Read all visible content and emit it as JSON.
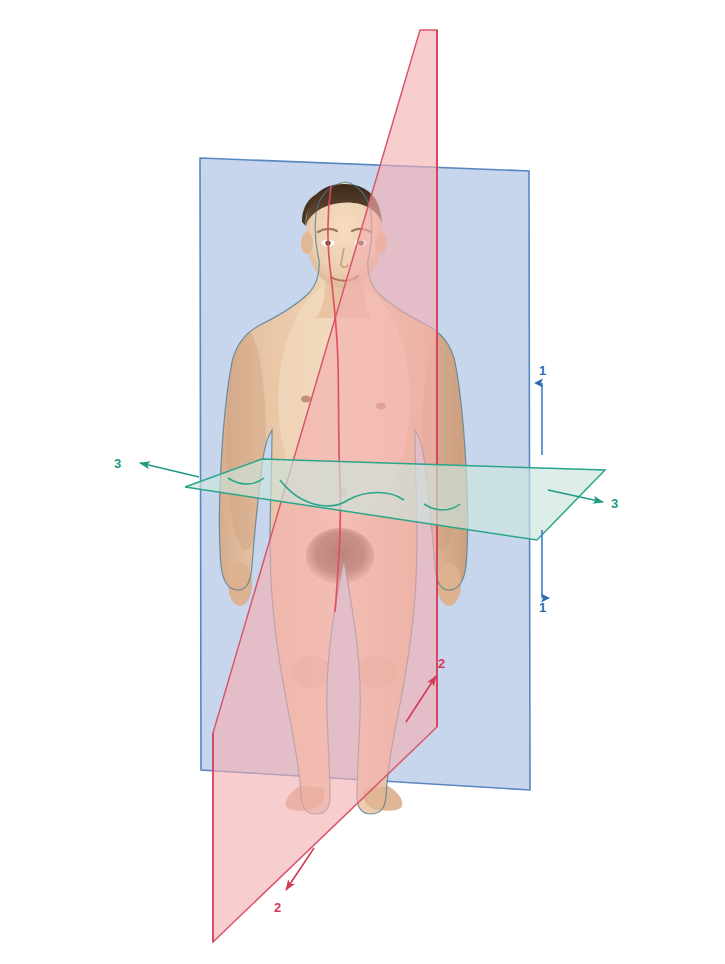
{
  "figure": {
    "background_color": "#ffffff"
  },
  "planes": [
    {
      "id": "coronal-plane",
      "name": "Coronal (frontal) plane",
      "shape": "rectangle-perspective",
      "fill_color": "#b9cce8",
      "stroke_color": "#4a7fc0",
      "opacity": "0.72",
      "label_number": "1"
    },
    {
      "id": "sagittal-plane",
      "name": "Median sagittal plane",
      "shape": "parallelogram-perspective",
      "fill_color": "#f3aeb0",
      "stroke_color": "#d63a57",
      "opacity": "0.68",
      "label_number": "2"
    },
    {
      "id": "transverse-plane",
      "name": "Transverse (horizontal) plane",
      "shape": "parallelogram-perspective",
      "fill_color": "#cce5dc",
      "stroke_color": "#2aa58c",
      "opacity": "0.62",
      "label_number": "3"
    }
  ],
  "callouts": [
    {
      "id": "callout-1-up",
      "label": "1",
      "color": "#2e6db4",
      "direction": "up",
      "plane": "coronal-plane"
    },
    {
      "id": "callout-1-down",
      "label": "1",
      "color": "#2e6db4",
      "direction": "down",
      "plane": "coronal-plane"
    },
    {
      "id": "callout-2-upper-right",
      "label": "2",
      "color": "#d63a57",
      "direction": "up-right",
      "plane": "sagittal-plane"
    },
    {
      "id": "callout-2-lower-left",
      "label": "2",
      "color": "#d63a57",
      "direction": "down-left",
      "plane": "sagittal-plane"
    },
    {
      "id": "callout-3-left",
      "label": "3",
      "color": "#229a84",
      "direction": "left",
      "plane": "transverse-plane"
    },
    {
      "id": "callout-3-right",
      "label": "3",
      "color": "#229a84",
      "direction": "right",
      "plane": "transverse-plane"
    }
  ],
  "labels": {
    "one_top": "1",
    "one_bottom": "1",
    "two_upper": "2",
    "two_lower": "2",
    "three_left": "3",
    "three_right": "3"
  },
  "body_outline": {
    "midline_color": "#d63a57",
    "contour_color": "#3f6f8a",
    "waist_trace_color": "#2aa58c"
  }
}
